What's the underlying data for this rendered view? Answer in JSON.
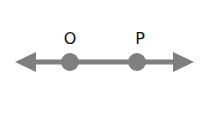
{
  "diagram": {
    "type": "line-with-points",
    "line_color": "#7f7f7f",
    "point_color": "#7f7f7f",
    "label_color": "#111111",
    "points": [
      {
        "label": "O",
        "x": 70,
        "y": 62
      },
      {
        "label": "P",
        "x": 137,
        "y": 62
      }
    ],
    "arrows": {
      "left": true,
      "right": true
    }
  }
}
